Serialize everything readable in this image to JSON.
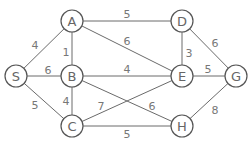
{
  "graph": {
    "node_radius": 11,
    "nodes": [
      {
        "id": "A",
        "label": "A",
        "x": 72,
        "y": 21
      },
      {
        "id": "D",
        "label": "D",
        "x": 182,
        "y": 21
      },
      {
        "id": "S",
        "label": "S",
        "x": 16,
        "y": 76
      },
      {
        "id": "B",
        "label": "B",
        "x": 72,
        "y": 76
      },
      {
        "id": "E",
        "label": "E",
        "x": 182,
        "y": 76
      },
      {
        "id": "G",
        "label": "G",
        "x": 236,
        "y": 76
      },
      {
        "id": "C",
        "label": "C",
        "x": 72,
        "y": 126
      },
      {
        "id": "H",
        "label": "H",
        "x": 182,
        "y": 126
      }
    ],
    "edges": [
      {
        "from": "A",
        "to": "D",
        "weight": "5",
        "lx": 127,
        "ly": 14
      },
      {
        "from": "A",
        "to": "E",
        "weight": "6",
        "lx": 127,
        "ly": 41
      },
      {
        "from": "S",
        "to": "A",
        "weight": "4",
        "lx": 35,
        "ly": 45
      },
      {
        "from": "A",
        "to": "B",
        "weight": "1",
        "lx": 66,
        "ly": 52
      },
      {
        "from": "S",
        "to": "B",
        "weight": "6",
        "lx": 48,
        "ly": 70
      },
      {
        "from": "S",
        "to": "C",
        "weight": "5",
        "lx": 35,
        "ly": 105
      },
      {
        "from": "B",
        "to": "E",
        "weight": "4",
        "lx": 127,
        "ly": 69
      },
      {
        "from": "B",
        "to": "H",
        "weight": "6",
        "lx": 152,
        "ly": 106
      },
      {
        "from": "B",
        "to": "C",
        "weight": "4",
        "lx": 66,
        "ly": 101
      },
      {
        "from": "C",
        "to": "E",
        "weight": "7",
        "lx": 101,
        "ly": 106
      },
      {
        "from": "C",
        "to": "H",
        "weight": "5",
        "lx": 127,
        "ly": 134
      },
      {
        "from": "D",
        "to": "E",
        "weight": "3",
        "lx": 189,
        "ly": 53
      },
      {
        "from": "D",
        "to": "G",
        "weight": "6",
        "lx": 215,
        "ly": 43
      },
      {
        "from": "E",
        "to": "G",
        "weight": "5",
        "lx": 208,
        "ly": 69
      },
      {
        "from": "H",
        "to": "G",
        "weight": "8",
        "lx": 215,
        "ly": 110
      }
    ]
  }
}
